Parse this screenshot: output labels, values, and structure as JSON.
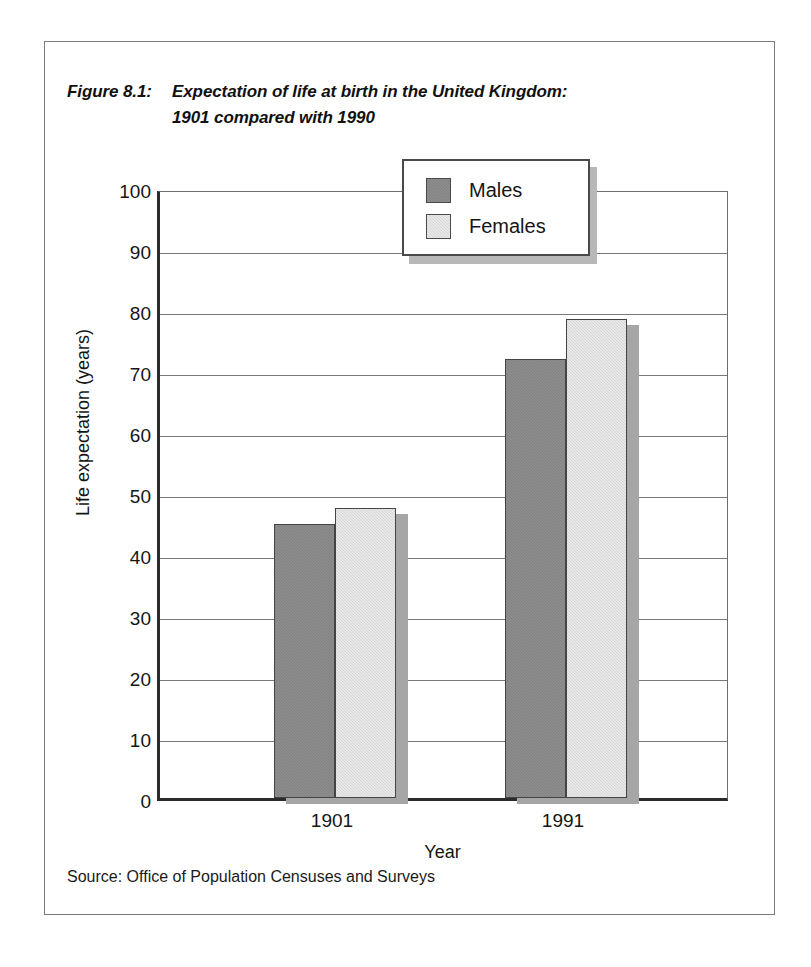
{
  "figure": {
    "label": "Figure 8.1:",
    "title_line1": "Expectation of life at birth in the United Kingdom:",
    "title_line2": "1901 compared with 1990",
    "source": "Source: Office of Population Censuses and Surveys"
  },
  "legend": {
    "items": [
      {
        "label": "Males",
        "color": "#808080"
      },
      {
        "label": "Females",
        "color": "#d6d6d6"
      }
    ]
  },
  "axes": {
    "y_title": "Life expectation (years)",
    "x_title": "Year",
    "y_ticks": [
      "100",
      "90",
      "80",
      "70",
      "60",
      "50",
      "40",
      "30",
      "20",
      "10",
      "0"
    ],
    "x_ticks": [
      "1901",
      "1991"
    ]
  },
  "chart_data": {
    "type": "bar",
    "xlabel": "Year",
    "ylabel": "Life expectation (years)",
    "ylim": [
      0,
      100
    ],
    "ytick_step": 10,
    "grid": true,
    "legend_position": "top-center",
    "categories": [
      "1901",
      "1991"
    ],
    "series": [
      {
        "name": "Males",
        "color": "#808080",
        "values": [
          45,
          72
        ]
      },
      {
        "name": "Females",
        "color": "#d6d6d6",
        "values": [
          47.5,
          78.5
        ]
      }
    ],
    "source": "Office of Population Censuses and Surveys"
  }
}
